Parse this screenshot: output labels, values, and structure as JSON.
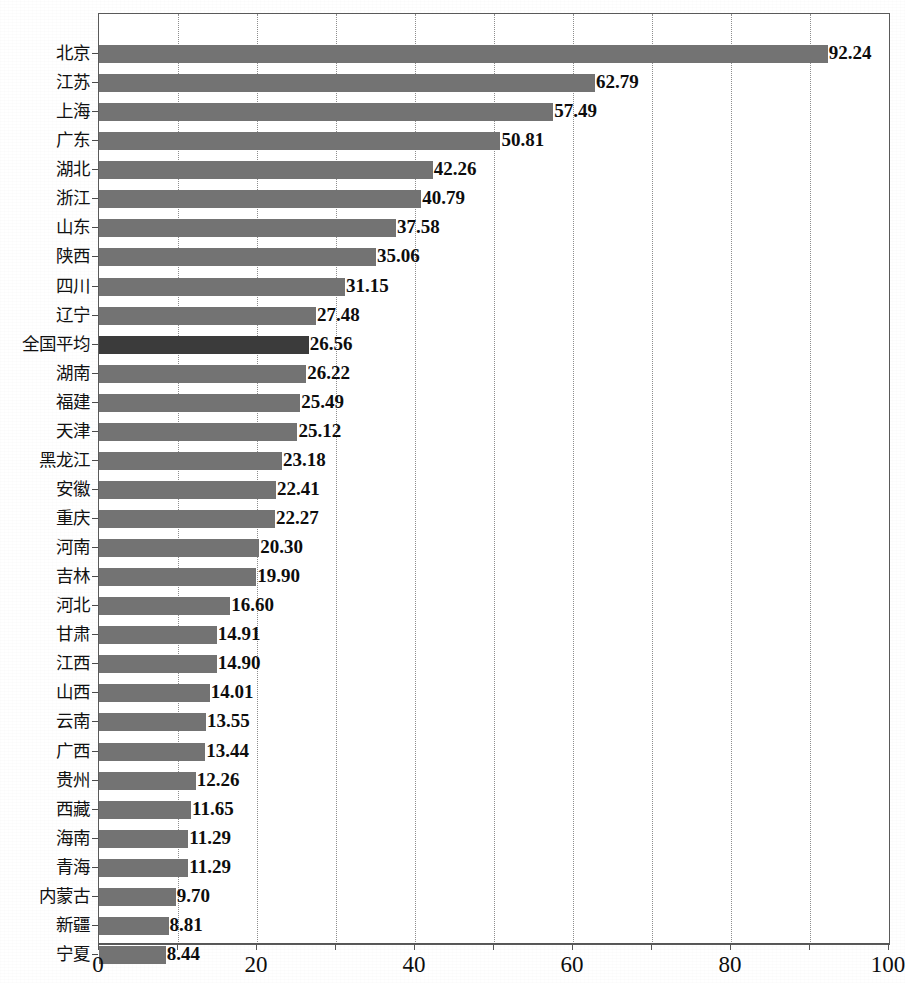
{
  "chart_data": {
    "type": "bar",
    "orientation": "horizontal",
    "title": "",
    "subtitle": "",
    "xlabel": "",
    "ylabel": "",
    "xlim": [
      0,
      100
    ],
    "grid": true,
    "grid_axis": "x",
    "legend": false,
    "highlight_category": "全国平均",
    "colors": {
      "bar": "#737373",
      "bar_highlight": "#3b3b3b",
      "frame": "#5a5a5a",
      "gridline": "#8d8d8d",
      "text": "#0d0d0d"
    },
    "x_ticks_major": [
      0,
      20,
      40,
      60,
      80,
      100
    ],
    "x_tick_labels": [
      "0",
      "20",
      "40",
      "60",
      "80",
      "100"
    ],
    "x_gridlines": [
      10,
      20,
      30,
      40,
      50,
      60,
      70,
      80,
      90
    ],
    "categories": [
      "北京",
      "江苏",
      "上海",
      "广东",
      "湖北",
      "浙江",
      "山东",
      "陕西",
      "四川",
      "辽宁",
      "全国平均",
      "湖南",
      "福建",
      "天津",
      "黑龙江",
      "安徽",
      "重庆",
      "河南",
      "吉林",
      "河北",
      "甘肃",
      "江西",
      "山西",
      "云南",
      "广西",
      "贵州",
      "西藏",
      "海南",
      "青海",
      "内蒙古",
      "新疆",
      "宁夏"
    ],
    "values": [
      92.24,
      62.79,
      57.49,
      50.81,
      42.26,
      40.79,
      37.58,
      35.06,
      31.15,
      27.48,
      26.56,
      26.22,
      25.49,
      25.12,
      23.18,
      22.41,
      22.27,
      20.3,
      19.9,
      16.6,
      14.91,
      14.9,
      14.01,
      13.55,
      13.44,
      12.26,
      11.65,
      11.29,
      11.29,
      9.7,
      8.81,
      8.44
    ],
    "value_labels": [
      "92.24",
      "62.79",
      "57.49",
      "50.81",
      "42.26",
      "40.79",
      "37.58",
      "35.06",
      "31.15",
      "27.48",
      "26.56",
      "26.22",
      "25.49",
      "25.12",
      "23.18",
      "22.41",
      "22.27",
      "20.30",
      "19.90",
      "16.60",
      "14.91",
      "14.90",
      "14.01",
      "13.55",
      "13.44",
      "12.26",
      "11.65",
      "11.29",
      "11.29",
      "9.70",
      "8.81",
      "8.44"
    ]
  },
  "background_artifacts": {
    "bleed_a": "的 发 展 水 平 与 结 构 特 征",
    "bleed_b": "区 域 创 新",
    "bleed_c": "中 国 区 域"
  }
}
